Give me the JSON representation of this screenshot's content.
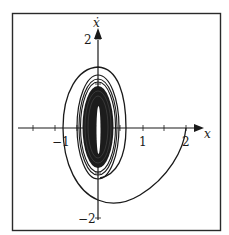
{
  "figure": {
    "type": "phase-portrait",
    "axes": {
      "x_label": "x",
      "y_label": "ẋ",
      "x_ticks": [
        {
          "value": -1,
          "label": "−1"
        },
        {
          "value": 1,
          "label": "1"
        },
        {
          "value": 2,
          "label": "2"
        }
      ],
      "y_ticks": [
        {
          "value": 2,
          "label": "2"
        },
        {
          "value": -2,
          "label": "−2"
        }
      ]
    },
    "trajectory": {
      "start_point": [
        2,
        0
      ],
      "converges_to": [
        0,
        0
      ],
      "behavior": "spiral inward, elongated vertically"
    },
    "colors": {
      "ink": "#1a1a1a",
      "background": "#ffffff",
      "frame": "#2a2a2a"
    }
  }
}
